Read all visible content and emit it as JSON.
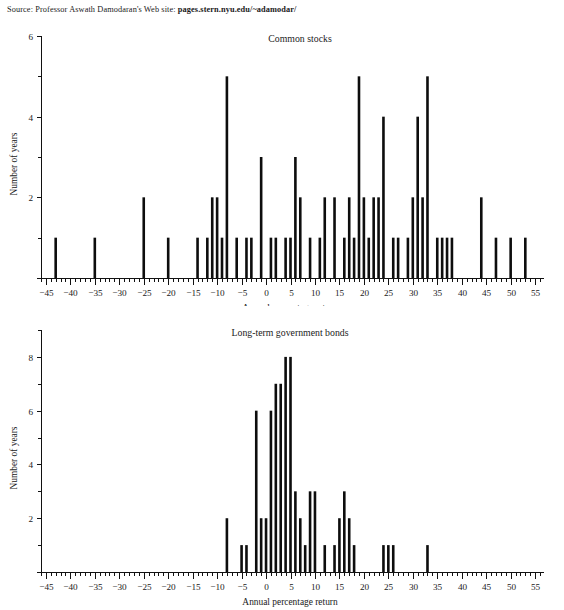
{
  "source": {
    "prefix": "Source: Professor Aswath Damodaran's Web site:",
    "url": "pages.stern.nyu.edu/~adamodar/"
  },
  "chart_data": [
    {
      "type": "bar",
      "name": "common-stocks",
      "title": "Common stocks",
      "xlabel": "Annual percentage return",
      "ylabel": "Number of years",
      "xlim": [
        -46,
        56
      ],
      "ylim": [
        0,
        6
      ],
      "xticks": [
        -45,
        -40,
        -35,
        -30,
        -25,
        -20,
        -15,
        -10,
        -5,
        0,
        5,
        10,
        15,
        20,
        25,
        30,
        35,
        40,
        45,
        50,
        55
      ],
      "yticks": [
        2,
        4,
        6
      ],
      "minor_tick_step": 1,
      "grid": false,
      "legend": "none",
      "bin_width": 1,
      "x": [
        -43,
        -35,
        -25,
        -20,
        -14,
        -12,
        -11,
        -10,
        -9,
        -8,
        -6,
        -4,
        -3,
        -1,
        1,
        2,
        4,
        5,
        6,
        7,
        9,
        11,
        12,
        14,
        16,
        17,
        18,
        19,
        20,
        21,
        22,
        23,
        24,
        26,
        27,
        29,
        30,
        31,
        32,
        33,
        35,
        36,
        37,
        38,
        44,
        47,
        50,
        53
      ],
      "values": [
        1,
        1,
        2,
        1,
        1,
        1,
        2,
        2,
        1,
        5,
        1,
        1,
        1,
        3,
        1,
        1,
        1,
        1,
        3,
        2,
        1,
        1,
        2,
        2,
        1,
        2,
        1,
        5,
        2,
        1,
        2,
        2,
        4,
        1,
        1,
        1,
        2,
        4,
        2,
        5,
        1,
        1,
        1,
        1,
        2,
        1,
        1,
        1
      ]
    },
    {
      "type": "bar",
      "name": "long-term-government-bonds",
      "title": "Long-term government bonds",
      "xlabel": "Annual percentage return",
      "ylabel": "Number of years",
      "xlim": [
        -46,
        56
      ],
      "ylim": [
        0,
        9
      ],
      "xticks": [
        -45,
        -40,
        -35,
        -30,
        -25,
        -20,
        -15,
        -10,
        -5,
        0,
        5,
        10,
        15,
        20,
        25,
        30,
        35,
        40,
        45,
        50,
        55
      ],
      "yticks": [
        2,
        4,
        6,
        8
      ],
      "minor_tick_step": 1,
      "grid": false,
      "legend": "none",
      "bin_width": 1,
      "x": [
        -8,
        -5,
        -4,
        -2,
        -1,
        0,
        1,
        2,
        3,
        4,
        5,
        6,
        7,
        8,
        9,
        10,
        12,
        14,
        15,
        16,
        17,
        18,
        24,
        25,
        26,
        33
      ],
      "values": [
        2,
        1,
        1,
        6,
        2,
        2,
        6,
        7,
        7,
        8,
        8,
        3,
        2,
        1,
        3,
        3,
        1,
        1,
        2,
        3,
        2,
        1,
        1,
        1,
        1,
        1
      ]
    }
  ]
}
